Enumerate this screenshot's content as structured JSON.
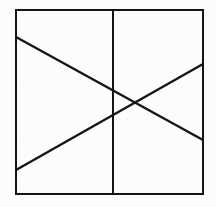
{
  "figure": {
    "title": "Square with vertical divider and two crossing diagonals",
    "canvas": {
      "width": 216,
      "height": 207
    },
    "background_color": "#fcfcfc",
    "stroke_color": "#151515",
    "stroke_width": 2,
    "square": {
      "label": "outer square border",
      "left": 16,
      "top": 10,
      "right": 203,
      "bottom": 194,
      "width": 187,
      "height": 184
    },
    "vertical_divider": {
      "label": "vertical divider line",
      "x": 113,
      "y1": 10,
      "y2": 194
    },
    "diagonals": [
      {
        "name": "descending-diagonal",
        "label": "diagonal from upper-left to lower-right",
        "x1": 16,
        "y1": 37,
        "x2": 203,
        "y2": 140
      },
      {
        "name": "ascending-diagonal",
        "label": "diagonal from lower-left to upper-right",
        "x1": 16,
        "y1": 170,
        "x2": 203,
        "y2": 64
      }
    ],
    "intersection": {
      "label": "diagonal crossing point",
      "x": 136,
      "y": 103
    }
  }
}
